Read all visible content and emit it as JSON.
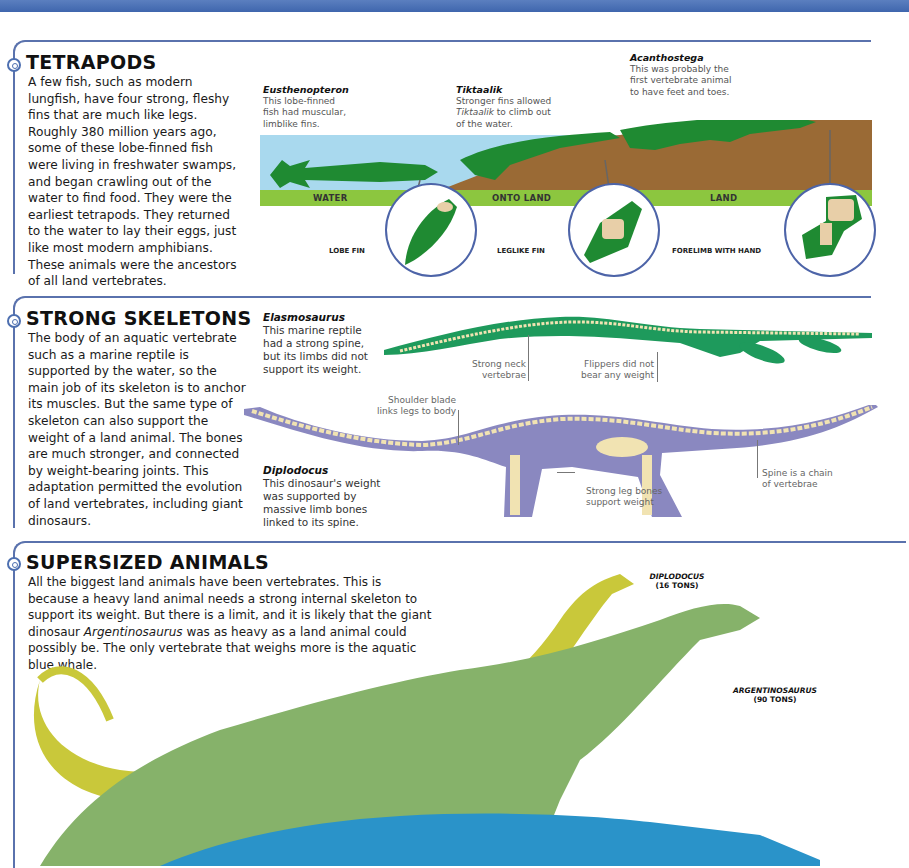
{
  "colors": {
    "accent_blue": "#5a72ad",
    "fin_green": "#1f8a32",
    "skeleton_green": "#1e9a5c",
    "skeleton_purple": "#8a88c0",
    "bone": "#f1e3b2",
    "land_brown": "#9a6a35",
    "water_blue": "#a9d9ee",
    "band_green": "#8cc63f",
    "diplodocus_yellow": "#c9c83a",
    "argentinosaurus_green": "#86b26a",
    "whale_blue": "#2a93c9"
  },
  "tetrapods": {
    "heading": "TETRAPODS",
    "body": "A few fish, such as modern lungfish, have four strong, fleshy fins that are much like legs. Roughly 380 million years ago, some of these lobe-finned fish were living in freshwater swamps, and began crawling out of the water to find food. They were the earliest tetrapods. They returned to the water to lay their eggs, just like most modern amphibians. These animals were the ancestors of all land vertebrates.",
    "captions": [
      {
        "title": "Eusthenopteron",
        "text": "This lobe-finned fish had muscular, limblike fins."
      },
      {
        "title": "Tiktaalik",
        "text_pre": "Stronger fins allowed ",
        "text_italic": "Tiktaalik",
        "text_post": " to climb out of the water."
      },
      {
        "title": "Acanthostega",
        "text": "This was probably the first vertebrate animal to have feet and toes."
      }
    ],
    "bands": [
      "WATER",
      "ONTO LAND",
      "LAND"
    ],
    "fins": [
      "LOBE FIN",
      "LEGLIKE FIN",
      "FORELIMB WITH HAND"
    ]
  },
  "skeletons": {
    "heading": "STRONG SKELETONS",
    "body": "The body of an aquatic vertebrate such as a marine reptile is supported by the water, so the main job of its skeleton is to anchor its muscles. But the same type of skeleton can also support the weight of a land animal. The bones are much stronger, and connected by weight-bearing joints. This adaptation permitted the evolution of land vertebrates, including giant dinosaurs.",
    "elasmosaurus": {
      "title": "Elasmosaurus",
      "text": "This marine reptile had a strong spine, but its limbs did not support its weight."
    },
    "diplodocus": {
      "title": "Diplodocus",
      "text": "This dinosaur's weight was supported by massive limb bones linked to its spine."
    },
    "labels": {
      "neck": "Strong neck vertebrae",
      "flippers": "Flippers did not bear any weight",
      "shoulder": "Shoulder blade links legs to body",
      "legs": "Strong leg bones support weight",
      "spine": "Spine is a chain of vertebrae"
    }
  },
  "supersized": {
    "heading": "SUPERSIZED ANIMALS",
    "body_pre": "All the biggest land animals have been vertebrates. This is because a heavy land animal needs a strong internal skeleton to support its weight. But there is a limit, and it is likely that the giant dinosaur ",
    "body_italic": "Argentinosaurus",
    "body_post": " was as heavy as a land animal could possibly be. The only vertebrate that weighs more is the aquatic blue whale.",
    "tags": [
      {
        "name": "DIPLODOCUS",
        "weight": "(16 TONS)"
      },
      {
        "name": "ARGENTINOSAURUS",
        "weight": "(90 TONS)"
      }
    ]
  }
}
